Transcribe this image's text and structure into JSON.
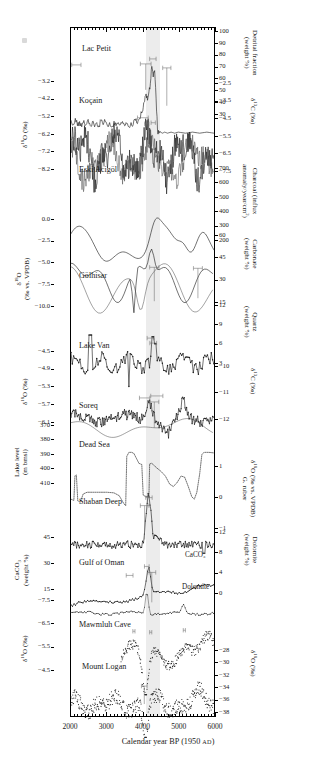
{
  "figure": {
    "x_axis": {
      "title_main": "Calendar year BP (1950 ",
      "title_era": "AD",
      "title_end": ")",
      "ticks": [
        2000,
        3000,
        4000,
        5000,
        6000
      ],
      "min": 2000,
      "max": 6000
    },
    "event_band": {
      "start": 4100,
      "end": 4500,
      "color": "#ececec"
    }
  },
  "chart_data": {
    "type": "line",
    "title": "",
    "xlabel": "Calendar year BP (1950 AD)",
    "xlim": [
      2000,
      6000
    ],
    "grid": false,
    "legend": "none",
    "shaded_interval": [
      4100,
      4500
    ],
    "panels": [
      {
        "site": "Lac Petit",
        "left_axis": null,
        "right_axis": {
          "label": "Detrital fraction (weight %)",
          "ticks": [
            100,
            90,
            80,
            70,
            60,
            50,
            40,
            30
          ]
        },
        "series": [
          {
            "name": "detrital fraction",
            "style": "solid",
            "x": [
              2000,
              2060,
              2120,
              2180,
              2240,
              2300,
              2360,
              2420,
              2480,
              2540,
              2600,
              2660,
              2720,
              2780,
              2840,
              2900,
              2960,
              3020,
              3080,
              3140,
              3200,
              3260,
              3320,
              3380,
              3440,
              3500,
              3560,
              3620,
              3680,
              3740,
              3800,
              3860,
              3920,
              3980,
              4020,
              4060,
              4100,
              4140,
              4180,
              4220,
              4260,
              4300,
              4340,
              4380,
              4420,
              4460,
              4500,
              4560,
              4620,
              4700,
              4800,
              4900,
              5000,
              5200,
              5400,
              5600,
              5800,
              6000
            ],
            "y": [
              45,
              41,
              47,
              40,
              44,
              39,
              45,
              41,
              46,
              40,
              44,
              39,
              43,
              40,
              45,
              41,
              44,
              40,
              43,
              39,
              42,
              40,
              43,
              41,
              44,
              40,
              42,
              39,
              43,
              41,
              45,
              42,
              47,
              52,
              57,
              63,
              70,
              64,
              72,
              80,
              96,
              86,
              92,
              66,
              36,
              33,
              34,
              33,
              34,
              33,
              34,
              33,
              34,
              33,
              34,
              33,
              34,
              33
            ]
          }
        ],
        "error_bars": [
          {
            "x": 2150,
            "span": 260
          },
          {
            "x": 4090,
            "span": 300
          },
          {
            "x": 4290,
            "span": 180
          },
          {
            "x": 4680,
            "span": 230
          }
        ]
      },
      {
        "site": "Koçain",
        "left_axis": {
          "label": "δ¹⁸O (‰)",
          "ticks": [
            -3.2,
            -4.2,
            -5.2,
            -6.2,
            -7.2,
            -8.2
          ]
        },
        "right_axis": {
          "label": "δ¹³C (‰)",
          "ticks": [
            -2.5,
            -3.5,
            -4.5,
            -5.5,
            -6.5,
            -7.5
          ]
        },
        "series": [
          {
            "name": "δ¹⁸O",
            "style": "solid"
          },
          {
            "name": "δ¹³C",
            "style": "solid"
          }
        ],
        "error_bars": [
          {
            "x": 4010,
            "span": 300
          },
          {
            "x": 4120,
            "span": 120
          },
          {
            "x": 4300,
            "span": 120
          }
        ]
      },
      {
        "site": "Eski Acigöl",
        "left_axis": null,
        "right_axis": {
          "label": "Charcoal (influx anomaly/year/cm²)",
          "ticks": [
            700,
            600,
            500,
            400,
            300,
            200
          ]
        },
        "series": [
          {
            "name": "charcoal influx",
            "style": "solid"
          }
        ],
        "error_bars": []
      },
      {
        "site": "Gölhisar",
        "left_axis": {
          "label": "δ¹⁸O (‰ vs. VPDB)",
          "ticks": [
            0.0,
            -2.5,
            -5.0,
            -7.5,
            -10.0
          ]
        },
        "right_axis": {
          "label": "Carbonate (weight %)",
          "ticks": [
            60,
            45,
            30,
            15
          ]
        },
        "series": [
          {
            "name": "δ¹⁸O",
            "style": "solid"
          },
          {
            "name": "carbonate",
            "style": "solid"
          }
        ],
        "error_bars": [
          {
            "x": 4330,
            "span": 260
          },
          {
            "x": 5550,
            "span": 250
          }
        ]
      },
      {
        "site": "Lake Van",
        "left_axis": null,
        "right_axis": {
          "label": "Quartz (weight %)",
          "ticks": [
            12,
            9,
            6,
            3
          ]
        },
        "series": [
          {
            "name": "quartz",
            "style": "solid-markers"
          }
        ],
        "error_bars": [
          {
            "x": 4230,
            "span": 200
          },
          {
            "x": 4300,
            "span": 190
          }
        ]
      },
      {
        "site": "Soreq",
        "left_axis": {
          "label": "δ¹⁸O (‰)",
          "ticks": [
            -4.5,
            -4.9,
            -5.3,
            -5.7,
            -6.1
          ]
        },
        "right_axis": {
          "label": "δ¹³C (‰)",
          "ticks": [
            -10,
            -11,
            -12
          ]
        },
        "series": [
          {
            "name": "δ¹⁸O",
            "style": "solid-markers"
          },
          {
            "name": "δ¹³C",
            "style": "solid"
          }
        ],
        "error_bars": [
          {
            "x": 4060,
            "span": 290
          },
          {
            "x": 4400,
            "span": 340
          },
          {
            "x": 4330,
            "span": 250
          }
        ]
      },
      {
        "site": "Dead Sea",
        "left_axis": {
          "label": "Lake level (m bmsl)",
          "ticks": [
            370,
            380,
            390,
            400,
            410
          ]
        },
        "right_axis": null,
        "series": [
          {
            "name": "lake level",
            "style": "dotted"
          }
        ],
        "error_bars": []
      },
      {
        "site": "Shaban Deep",
        "left_axis": null,
        "right_axis": {
          "label": "δ¹⁸O (‰ vs. VPDB) G. ruber",
          "ticks": [
            1,
            0,
            -1
          ]
        },
        "series": [
          {
            "name": "G. ruber δ¹⁸O",
            "style": "solid-markers"
          }
        ],
        "error_bars": [
          {
            "x": 4180,
            "span": 180
          },
          {
            "x": 4060,
            "span": 240
          }
        ]
      },
      {
        "site": "Gulf of Oman",
        "left_axis": {
          "label": "CaCO₃ (weight %)",
          "ticks": [
            45,
            30,
            15
          ]
        },
        "right_axis": {
          "label": "Dolomite (weight %)",
          "ticks": [
            12,
            8,
            4,
            0
          ]
        },
        "inline_labels": [
          "CaCO₃",
          "Dolomite"
        ],
        "series": [
          {
            "name": "CaCO₃",
            "style": "solid-markers"
          },
          {
            "name": "Dolomite",
            "style": "solid-markers"
          }
        ],
        "error_bars": [
          {
            "x": 3640,
            "span": 190
          },
          {
            "x": 4120,
            "span": 130
          },
          {
            "x": 4260,
            "span": 220
          }
        ]
      },
      {
        "site": "Mawmluh Cave",
        "left_axis": {
          "label": "δ¹⁸O (‰)",
          "ticks": [
            -7.5,
            -6.5,
            -5.5,
            -4.5
          ]
        },
        "right_axis": null,
        "series": [
          {
            "name": "δ¹⁸O",
            "style": "markers"
          }
        ],
        "error_bars": [
          {
            "x": 3760,
            "span": 60
          },
          {
            "x": 4230,
            "span": 60
          },
          {
            "x": 5170,
            "span": 60
          }
        ]
      },
      {
        "site": "Mount Logan",
        "left_axis": null,
        "right_axis": {
          "label": "δ¹⁸O (‰)",
          "ticks": [
            -28,
            -30,
            -32,
            -34,
            -36,
            -38
          ]
        },
        "series": [
          {
            "name": "δ¹⁸O",
            "style": "markers"
          }
        ],
        "error_bars": [
          {
            "x": 4050,
            "span": 160
          }
        ]
      }
    ]
  }
}
